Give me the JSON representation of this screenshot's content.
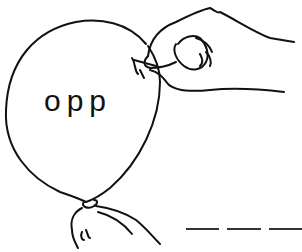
{
  "illustration": {
    "subject": "hand-popping-balloon-with-pin",
    "balloon_text": "opp",
    "answer_blanks": 3,
    "line_color": "#111111",
    "background": "#ffffff"
  }
}
